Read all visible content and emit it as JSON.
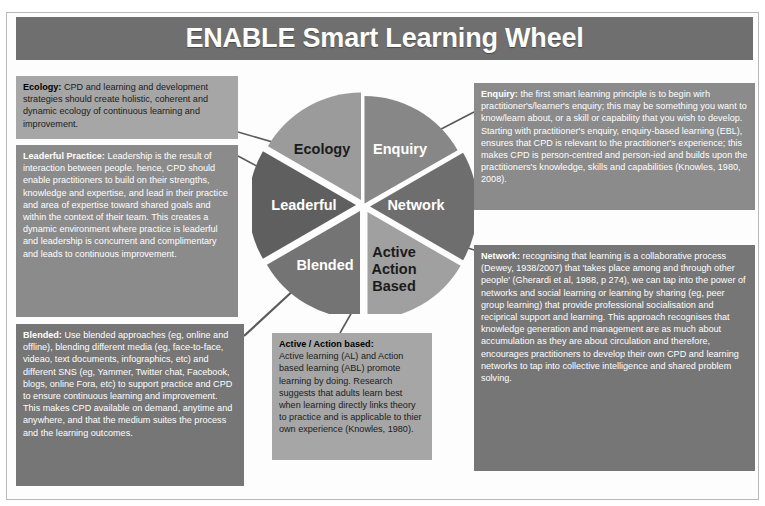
{
  "header": {
    "title": "ENABLE Smart Learning Wheel"
  },
  "wheel": {
    "segments": [
      {
        "key": "enquiry",
        "label": "Enquiry",
        "color": "#878787",
        "text_on": "dark"
      },
      {
        "key": "network",
        "label": "Network",
        "color": "#6e6e6e",
        "text_on": "dark"
      },
      {
        "key": "active",
        "label": "Active\nAction\nBased",
        "color": "#a0a0a0",
        "text_on": "light"
      },
      {
        "key": "blended",
        "label": "Blended",
        "color": "#747474",
        "text_on": "dark"
      },
      {
        "key": "leaderful",
        "label": "Leaderful",
        "color": "#5f5f5f",
        "text_on": "dark"
      },
      {
        "key": "ecology",
        "label": "Ecology",
        "color": "#9b9b9b",
        "text_on": "light"
      }
    ],
    "active_label_lines": [
      "Active",
      "Action",
      "Based"
    ]
  },
  "boxes": {
    "ecology": {
      "lead": "Ecology:",
      "body": " CPD and learning and development strategies should create holistic, coherent and dynamic ecology of continuous learning and improvement."
    },
    "leaderful": {
      "lead": "Leaderful Practice:",
      "body": " Leadership is the result of interaction between people. hence, CPD should enable practitioners to build on their strengths, knowledge and expertise, and lead in their practice and area of expertise toward shared goals and within the context of their team. This creates a dynamic environment where practice is leaderful and leadership is concurrent and complimentary and leads to continuous improvement."
    },
    "blended": {
      "lead": "Blended:",
      "body": " Use blended approaches (eg, online and offline), blending different media (eg, face-to-face, videao, text documents, infographics, etc) and different SNS (eg, Yammer, Twitter chat, Facebook, blogs, online Fora, etc) to support practice and CPD to ensure continuous learning and improvement. This makes CPD available on demand, anytime and anywhere, and that the medium suites the process and the learning outcomes."
    },
    "active": {
      "lead": "Active / Action based:",
      "body": "Active learning (AL) and Action based learning (ABL) promote learning by doing. Research suggests that adults learn best when learning directly links theory to practice and is applicable to thier own experience (Knowles, 1980)."
    },
    "enquiry": {
      "lead": "Enquiry:",
      "body": " the first smart learning principle is to begin wirh practitioner's/learner's enquiry; this may be something you want to know/learn about, or a skill or capability that you wish to develop.  Starting with practitioner's enquiry, enquiry-based learning (EBL), ensures that CPD is relevant to the practitioner's experience; this makes CPD is person-centred and person-ied and builds upon the practitioners's knowledge, skills and capabilities (Knowles, 1980, 2008)."
    },
    "network": {
      "lead": "Network:",
      "body": " recognising that learning is a collaborative process (Dewey, 1938/2007) that 'takes place among and through other people' (Gherardi et al, 1988, p 274), we can tap into the power of networks and social learning or learning by sharing (eg, peer group learning) that provide professional socialisation and reciprical support and learning. This approach recognises that knowledge generation and management are as much about accumulation as they are about circulation and therefore, encourages practitioners to develop their own CPD and learning networks to tap into collective intelligence and shared problem solving."
    }
  },
  "colors": {
    "banner": "#6f6f6f",
    "box_light": "#a6a6a6",
    "box_mid": "#8b8b8b",
    "box_dark": "#767676",
    "frame_border": "#b9b9b9",
    "connector": "#5a5a5a"
  }
}
